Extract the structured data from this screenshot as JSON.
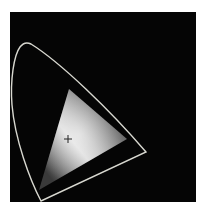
{
  "diagram": {
    "type": "CIE chromaticity gamut diagram",
    "background_color": "#050505",
    "locus": {
      "label": "spectral-locus",
      "stroke_color": "#d8d8d0"
    },
    "gamut_triangle": {
      "label": "color-gamut",
      "vertices_px": [
        [
          69,
          89
        ],
        [
          127,
          139
        ],
        [
          39,
          190
        ]
      ],
      "gradient_center_color": "#f2f2f2",
      "gradient_edge_color": "#2a2a2a"
    },
    "white_point": {
      "label": "white-point-marker",
      "position_px": [
        68,
        139
      ],
      "symbol": "+"
    }
  }
}
